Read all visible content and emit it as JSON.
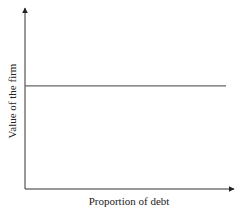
{
  "chart_data": {
    "type": "line",
    "title": "",
    "xlabel": "Proportion of debt",
    "ylabel": "Value of the firm",
    "grid": false,
    "legend": null,
    "x_ticks": [],
    "y_ticks": [],
    "series": [
      {
        "name": "Value of the firm",
        "description": "Horizontal line: firm value is constant regardless of proportion of debt",
        "x": [
          0,
          1
        ],
        "values": [
          0.57,
          0.57
        ]
      }
    ],
    "xlim": [
      0,
      1
    ],
    "ylim": [
      0,
      1
    ]
  },
  "colors": {
    "axis": "#333333",
    "line": "#666666",
    "text": "#222222"
  }
}
